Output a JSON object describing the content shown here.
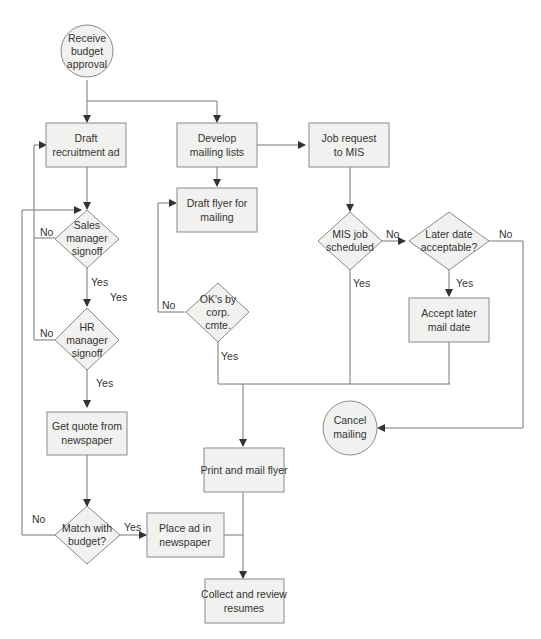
{
  "diagram": {
    "type": "flowchart",
    "nodes": {
      "start": {
        "line1": "Receive",
        "line2": "budget",
        "line3": "approval"
      },
      "draft_ad": {
        "line1": "Draft",
        "line2": "recruitment ad"
      },
      "develop_lists": {
        "line1": "Develop",
        "line2": "mailing lists"
      },
      "job_request": {
        "line1": "Job request",
        "line2": "to MIS"
      },
      "draft_flyer": {
        "line1": "Draft flyer for",
        "line2": "mailing"
      },
      "sales_signoff": {
        "line1": "Sales",
        "line2": "manager",
        "line3": "signoff"
      },
      "mis_scheduled": {
        "line1": "MIS job",
        "line2": "scheduled"
      },
      "later_date": {
        "line1": "Later date",
        "line2": "acceptable?"
      },
      "hr_signoff": {
        "line1": "HR",
        "line2": "manager",
        "line3": "signoff"
      },
      "oks_corp": {
        "line1": "OK's by",
        "line2": "corp.",
        "line3": "cmte."
      },
      "accept_later": {
        "line1": "Accept later",
        "line2": "mail date"
      },
      "get_quote": {
        "line1": "Get quote from",
        "line2": "newspaper"
      },
      "cancel": {
        "line1": "Cancel",
        "line2": "mailing"
      },
      "print_mail": {
        "line1": "Print and mail flyer"
      },
      "match_budget": {
        "line1": "Match with",
        "line2": "budget?"
      },
      "place_ad": {
        "line1": "Place ad in",
        "line2": "newspaper"
      },
      "collect": {
        "line1": "Collect and review",
        "line2": "resumes"
      }
    },
    "edge_labels": {
      "sales_no": "No",
      "sales_yes": "Yes",
      "sales_yes_extra": "Yes",
      "hr_no": "No",
      "hr_yes": "Yes",
      "match_no": "No",
      "match_yes": "Yes",
      "oks_no": "No",
      "oks_yes": "Yes",
      "mis_no": "No",
      "mis_yes": "Yes",
      "later_no": "No",
      "later_yes": "Yes"
    }
  }
}
